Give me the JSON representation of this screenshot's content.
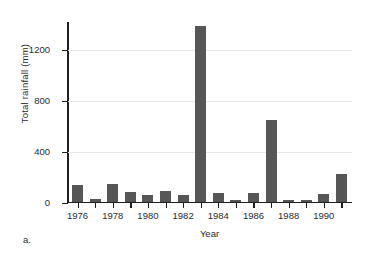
{
  "figure": {
    "caption": "a."
  },
  "chart_data": {
    "type": "bar",
    "title": "",
    "xlabel": "Year",
    "ylabel": "Total rainfall (mm)",
    "categories": [
      1976,
      1977,
      1978,
      1979,
      1980,
      1981,
      1982,
      1983,
      1984,
      1985,
      1986,
      1987,
      1988,
      1989,
      1990,
      1991
    ],
    "values": [
      130,
      22,
      140,
      75,
      52,
      80,
      52,
      1376,
      70,
      14,
      68,
      640,
      12,
      10,
      58,
      215
    ],
    "xlim": [
      1975.4,
      1991.6
    ],
    "ylim": [
      0,
      1420
    ],
    "yticks": [
      0,
      400,
      800,
      1200
    ],
    "ytick_labels": [
      "0",
      "400",
      "800",
      "1200"
    ],
    "xticks": [
      1976,
      1978,
      1980,
      1982,
      1984,
      1986,
      1988,
      1990
    ],
    "xtick_labels": [
      "1976",
      "1978",
      "1980",
      "1982",
      "1984",
      "1986",
      "1988",
      "1990"
    ],
    "xminor_ticks": [
      1977,
      1979,
      1981,
      1983,
      1985,
      1987,
      1989,
      1991
    ],
    "grid": "horizontal",
    "bar_color": "#565656",
    "grid_color": "#e8e8e8",
    "axis_color": "#1f1f1f",
    "legend": "none"
  }
}
